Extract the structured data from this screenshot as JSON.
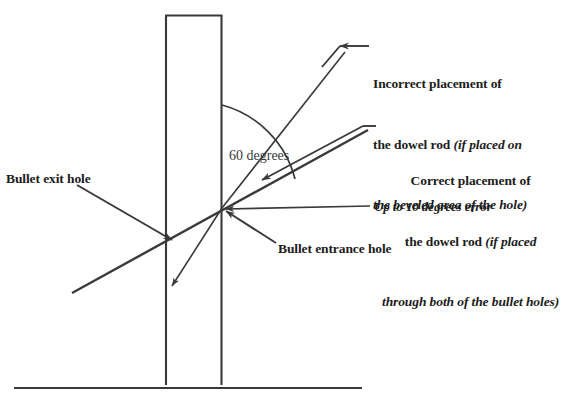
{
  "diagram": {
    "stroke_color": "#3a3a3a",
    "text_color": "#1c1c1c",
    "background_color": "#ffffff"
  },
  "labels": {
    "incorrect_placement": {
      "line1": "Incorrect placement of",
      "line2_bold": "the dowel rod ",
      "line2_italic": "(if placed on",
      "line3_italic": "the beveled area of the hole)"
    },
    "correct_placement": {
      "line1": "Correct placement of",
      "line2_bold": "the dowel rod ",
      "line2_italic": "(if placed",
      "line3_italic": "through both of the bullet holes)"
    },
    "error_note": "Up to 10 degrees error",
    "exit_hole": "Bullet exit hole",
    "entrance_hole": "Bullet entrance hole",
    "angle": "60 degrees"
  }
}
